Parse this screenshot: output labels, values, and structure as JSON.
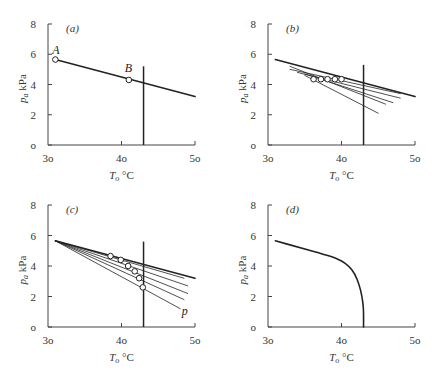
{
  "figure": {
    "panels": [
      "a",
      "b",
      "c",
      "d"
    ]
  },
  "chart_data": [
    {
      "panel": "(a)",
      "type": "line",
      "xlabel": "T_o °C",
      "ylabel": "p_a kPa",
      "xlim": [
        30,
        50
      ],
      "ylim": [
        0,
        8
      ],
      "xticks": [
        30,
        40,
        50
      ],
      "yticks": [
        0,
        2,
        4,
        6,
        8
      ],
      "grid": false,
      "series": [
        {
          "name": "main line",
          "x": [
            31,
            50
          ],
          "y": [
            5.65,
            3.2
          ],
          "width": 1.6
        }
      ],
      "vertical_line": {
        "x": 43,
        "y": [
          0,
          5.2
        ]
      },
      "markers": [
        {
          "label": "A",
          "x": 31,
          "y": 5.65
        },
        {
          "label": "B",
          "x": 41,
          "y": 4.3
        }
      ]
    },
    {
      "panel": "(b)",
      "type": "line",
      "xlabel": "T_o °C",
      "ylabel": "p_a kPa",
      "xlim": [
        30,
        50
      ],
      "ylim": [
        0,
        8
      ],
      "xticks": [
        30,
        40,
        50
      ],
      "yticks": [
        0,
        2,
        4,
        6,
        8
      ],
      "grid": false,
      "series": [
        {
          "name": "main line",
          "x": [
            31,
            50
          ],
          "y": [
            5.65,
            3.2
          ],
          "width": 1.6
        },
        {
          "name": "line 1",
          "x": [
            33,
            48
          ],
          "y": [
            5.0,
            3.4
          ],
          "width": 0.8
        },
        {
          "name": "line 2",
          "x": [
            34,
            48
          ],
          "y": [
            4.8,
            3.1
          ],
          "width": 0.8
        },
        {
          "name": "line 3",
          "x": [
            35,
            47
          ],
          "y": [
            4.7,
            2.8
          ],
          "width": 0.8
        },
        {
          "name": "line 4",
          "x": [
            33,
            46
          ],
          "y": [
            5.2,
            2.7
          ],
          "width": 0.8
        },
        {
          "name": "line 5",
          "x": [
            35,
            45
          ],
          "y": [
            4.6,
            2.1
          ],
          "width": 0.8
        }
      ],
      "vertical_line": {
        "x": 43,
        "y": [
          0,
          5.3
        ]
      },
      "markers": [
        {
          "x": 36.2,
          "y": 4.35
        },
        {
          "x": 37.2,
          "y": 4.35
        },
        {
          "x": 38.1,
          "y": 4.35
        },
        {
          "x": 39.1,
          "y": 4.35
        },
        {
          "x": 40.0,
          "y": 4.35
        }
      ]
    },
    {
      "panel": "(c)",
      "type": "line",
      "xlabel": "T_o °C",
      "ylabel": "p_a kPa",
      "xlim": [
        30,
        50
      ],
      "ylim": [
        0,
        8
      ],
      "xticks": [
        30,
        40,
        50
      ],
      "yticks": [
        0,
        2,
        4,
        6,
        8
      ],
      "grid": false,
      "series": [
        {
          "name": "main line",
          "x": [
            31,
            50
          ],
          "y": [
            5.65,
            3.2
          ],
          "width": 1.6
        },
        {
          "name": "line 1",
          "x": [
            31,
            48.5
          ],
          "y": [
            5.65,
            3.2
          ],
          "width": 0.8
        },
        {
          "name": "line 2",
          "x": [
            31,
            49
          ],
          "y": [
            5.65,
            2.7
          ],
          "width": 0.8
        },
        {
          "name": "line 3",
          "x": [
            31,
            49
          ],
          "y": [
            5.65,
            2.2
          ],
          "width": 0.8
        },
        {
          "name": "line 4",
          "x": [
            31,
            48.5
          ],
          "y": [
            5.65,
            1.8
          ],
          "width": 0.8
        },
        {
          "name": "line 5",
          "x": [
            31,
            48
          ],
          "y": [
            5.65,
            1.2
          ],
          "width": 0.8
        }
      ],
      "vertical_line": {
        "x": 43,
        "y": [
          0,
          5.6
        ]
      },
      "markers": [
        {
          "x": 38.5,
          "y": 4.65
        },
        {
          "x": 39.9,
          "y": 4.4
        },
        {
          "x": 40.9,
          "y": 4.0
        },
        {
          "x": 41.8,
          "y": 3.65
        },
        {
          "x": 42.4,
          "y": 3.2
        },
        {
          "x": 42.9,
          "y": 2.6
        }
      ],
      "annotations": [
        {
          "text": "p",
          "x": 48.2,
          "y": 0.8
        }
      ]
    },
    {
      "panel": "(d)",
      "type": "line",
      "xlabel": "T_o °C",
      "ylabel": "p_a kPa",
      "xlim": [
        30,
        50
      ],
      "ylim": [
        0,
        8
      ],
      "xticks": [
        30,
        40,
        50
      ],
      "yticks": [
        0,
        2,
        4,
        6,
        8
      ],
      "grid": false,
      "series": [
        {
          "name": "boundary curve",
          "x": [
            31,
            34,
            37,
            39,
            40,
            41,
            41.8,
            42.4,
            42.8,
            43,
            43,
            43
          ],
          "y": [
            5.65,
            5.25,
            4.85,
            4.55,
            4.35,
            4.0,
            3.5,
            2.8,
            2.0,
            1.2,
            0.5,
            0
          ],
          "width": 1.6
        }
      ]
    }
  ],
  "panels": {
    "a": {
      "label": "(a)",
      "point_a": "A",
      "point_b": "B"
    },
    "b": {
      "label": "(b)"
    },
    "c": {
      "label": "(c)",
      "note": "p"
    },
    "d": {
      "label": "(d)"
    }
  },
  "axes": {
    "xlabel_main": "T",
    "xlabel_sub": "o",
    "xlabel_unit": " °C",
    "ylabel_main": "p",
    "ylabel_sub": "a",
    "ylabel_unit": " kPa",
    "xtick_labels": [
      "3o",
      "4o",
      "5o"
    ],
    "ytick_labels": [
      "o",
      "2",
      "4",
      "6",
      "8"
    ]
  },
  "colors": {
    "ink": "#222222",
    "light_ink": "#555555",
    "background": "#ffffff"
  }
}
